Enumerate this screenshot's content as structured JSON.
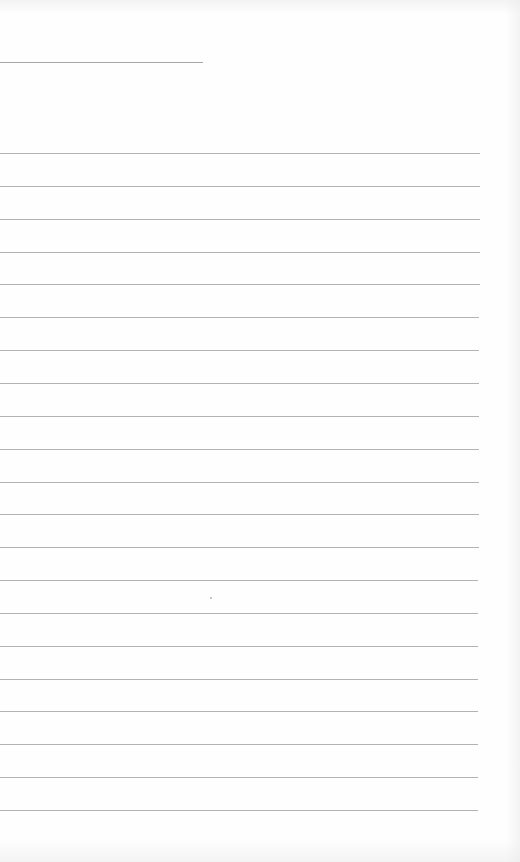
{
  "page": {
    "type": "blank lined paper",
    "background_color": "#fefefe",
    "line_color": "#9a9a9a",
    "header_rule": {
      "y": 62,
      "x_start": 0,
      "x_end": 203
    },
    "ruled_lines": {
      "count": 21,
      "first_y": 153,
      "last_y": 810,
      "spacing": 32.85,
      "x_start": 0,
      "x_end": 480
    },
    "text": []
  }
}
